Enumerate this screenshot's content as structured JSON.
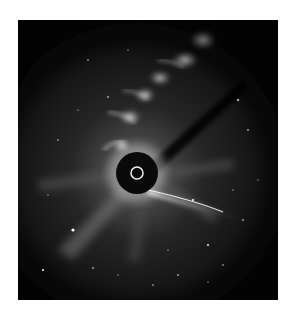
{
  "image": {
    "subject": "coronagraph image of the Sun with coronal mass ejection loops and sungrazing comet",
    "alt": "Coronagraph view: black occulting disk with white solar limb circle at center, bright streamer loops arcing toward upper right, comet tail extending right below the disk, starfield background",
    "colors": {
      "background": "#050505",
      "occulter": "#0a0a0a",
      "sun_ring": "#f2f2f2",
      "loop_glow": "#e8e8e8",
      "page": "#ffffff"
    }
  }
}
